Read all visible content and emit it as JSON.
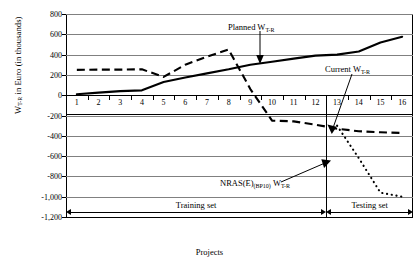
{
  "chart_data": {
    "type": "line",
    "title": "",
    "xlabel": "Projects",
    "ylabel": "W T-R in Euro (in thousands)",
    "ylabel_main": "W",
    "ylabel_sub": "T-R",
    "ylabel_rest": " in Euro (in thousands)",
    "categories": [
      1,
      2,
      3,
      4,
      5,
      6,
      7,
      8,
      9,
      10,
      11,
      12,
      13,
      14,
      15,
      16
    ],
    "ylim": [
      -1200,
      800
    ],
    "ytick_step": 200,
    "yticks": [
      "800",
      "600",
      "400",
      "200",
      "0",
      "-200",
      "-400",
      "-600",
      "-800",
      "-1,000",
      "-1,200"
    ],
    "ytick_values": [
      800,
      600,
      400,
      200,
      0,
      -200,
      -400,
      -600,
      -800,
      -1000,
      -1200
    ],
    "grid": true,
    "legend": "annotations",
    "series": [
      {
        "name": "Planned W T-R",
        "style": "solid",
        "values": [
          10,
          25,
          40,
          48,
          130,
          175,
          215,
          255,
          300,
          330,
          360,
          390,
          400,
          430,
          520,
          575
        ]
      },
      {
        "name": "Current W T-R",
        "style": "dashed",
        "values": [
          250,
          252,
          252,
          255,
          180,
          300,
          380,
          450,
          60,
          -250,
          -258,
          -290,
          -330,
          -355,
          -365,
          -372
        ]
      },
      {
        "name": "NRAS(E) (BP10) W T-R",
        "style": "dotted",
        "values": [
          null,
          null,
          null,
          null,
          null,
          null,
          null,
          null,
          null,
          null,
          null,
          null,
          -300,
          -620,
          -960,
          -1000
        ]
      }
    ],
    "annotations": [
      {
        "id": "planned",
        "text_main": "Planned W",
        "text_sub": "T-R"
      },
      {
        "id": "current",
        "text_main": "Current W",
        "text_sub": "T-R"
      },
      {
        "id": "nras",
        "text_a": "NRAS(E)",
        "text_sub1": "(BP10)",
        "text_b": "W",
        "text_sub2": "T-R"
      }
    ],
    "sets": [
      {
        "id": "training",
        "label": "Training set",
        "from": 1,
        "to": 12
      },
      {
        "id": "testing",
        "label": "Testing set",
        "from": 13,
        "to": 16
      }
    ],
    "colors": {
      "series": "#000000",
      "grid": "#808080",
      "axis": "#000000",
      "background": "#ffffff"
    }
  }
}
